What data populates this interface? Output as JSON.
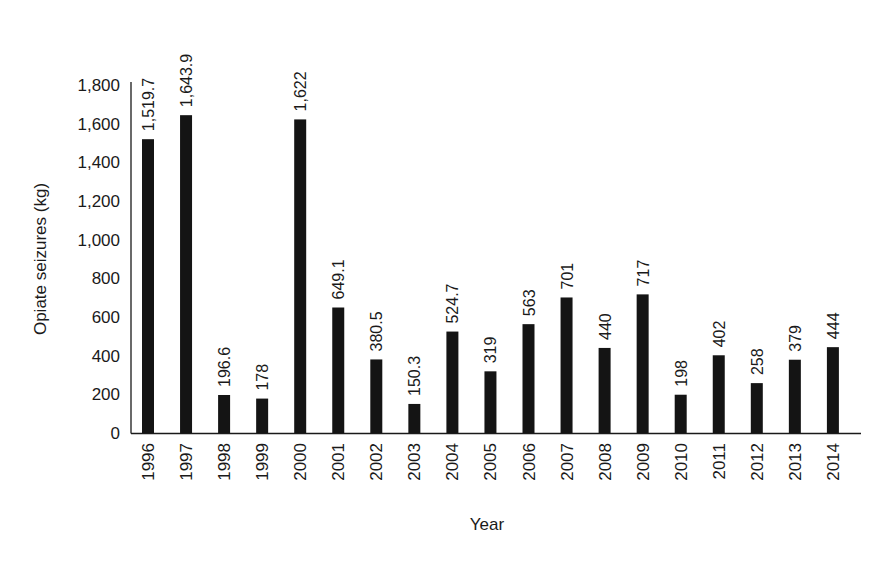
{
  "chart_data": {
    "type": "bar",
    "title": "",
    "xlabel": "Year",
    "ylabel": "Opiate seizures (kg)",
    "ylim": [
      0,
      1800
    ],
    "yticks": [
      0,
      200,
      400,
      600,
      800,
      1000,
      1200,
      1400,
      1600,
      1800
    ],
    "ytick_labels": [
      "0",
      "200",
      "400",
      "600",
      "800",
      "1,000",
      "1,200",
      "1,400",
      "1,600",
      "1,800"
    ],
    "grid": false,
    "legend": null,
    "categories": [
      "1996",
      "1997",
      "1998",
      "1999",
      "2000",
      "2001",
      "2002",
      "2003",
      "2004",
      "2005",
      "2006",
      "2007",
      "2008",
      "2009",
      "2010",
      "2011",
      "2012",
      "2013",
      "2014"
    ],
    "values": [
      1519.7,
      1643.9,
      196.6,
      178,
      1622,
      649.1,
      380.5,
      150.3,
      524.7,
      319,
      563,
      701,
      440,
      717,
      198,
      402,
      258,
      379,
      444
    ],
    "value_labels": [
      "1,519.7",
      "1,643.9",
      "196.6",
      "178",
      "1,622",
      "649.1",
      "380.5",
      "150.3",
      "524.7",
      "319",
      "563",
      "701",
      "440",
      "717",
      "198",
      "402",
      "258",
      "379",
      "444"
    ],
    "bar_color": "#141414"
  }
}
